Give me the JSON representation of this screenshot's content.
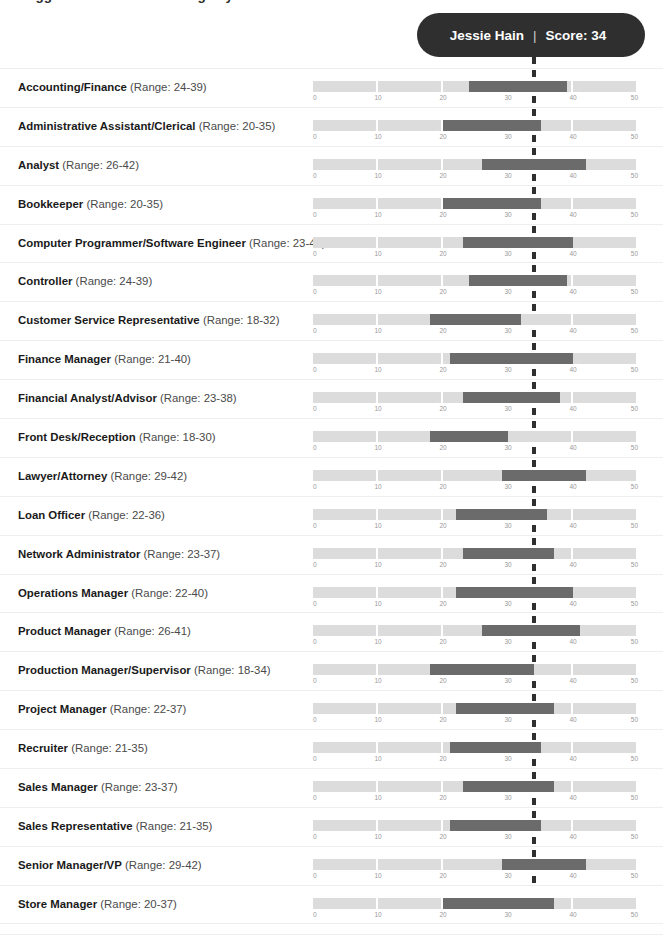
{
  "chart_title": "Suggested SCIM Score Range by Position",
  "badge": {
    "name": "Jessie Hain",
    "separator": "|",
    "score_label": "Score: 34",
    "score": 34,
    "background": "#2f2f2f",
    "text_color": "#ffffff"
  },
  "marker": {
    "name": "score-marker",
    "value": 34,
    "style": "dashed",
    "color": "#2f2f2f"
  },
  "axis": {
    "min": 0,
    "max": 50,
    "ticks": [
      0,
      10,
      20,
      30,
      40,
      50
    ],
    "tick_labels": [
      "0",
      "10",
      "20",
      "30",
      "40",
      "50"
    ],
    "segment_step": 10
  },
  "colors": {
    "track": "#dcdcdc",
    "fill": "#6b6b6b",
    "row_divider": "#eeeeee",
    "label": "#1a1a1a",
    "range_text": "#4a4a4a",
    "tick_text": "#9a9a9a",
    "page_background": "#ffffff"
  },
  "range_prefix": "(Range: ",
  "range_suffix": ")",
  "chart_data": {
    "type": "bar",
    "title": "Suggested SCIM Score Range by Position",
    "subtitle": "",
    "xlabel": "",
    "ylabel": "",
    "xlim": [
      0,
      50
    ],
    "grid": false,
    "legend": "none",
    "orientation": "horizontal-range",
    "marker_line": {
      "label": "Jessie Hain | Score: 34",
      "value": 34
    },
    "categories": [
      "Accounting/Finance",
      "Administrative Assistant/Clerical",
      "Analyst",
      "Bookkeeper",
      "Computer Programmer/Software Engineer",
      "Controller",
      "Customer Service Representative",
      "Finance Manager",
      "Financial Analyst/Advisor",
      "Front Desk/Reception",
      "Lawyer/Attorney",
      "Loan Officer",
      "Network Administrator",
      "Operations Manager",
      "Product Manager",
      "Production Manager/Supervisor",
      "Project Manager",
      "Recruiter",
      "Sales Manager",
      "Sales Representative",
      "Senior Manager/VP",
      "Store Manager"
    ],
    "range_low": [
      24,
      20,
      26,
      20,
      23,
      24,
      18,
      21,
      23,
      18,
      29,
      22,
      23,
      22,
      26,
      18,
      22,
      21,
      23,
      21,
      29,
      20
    ],
    "range_high": [
      39,
      35,
      42,
      35,
      40,
      39,
      32,
      40,
      38,
      30,
      42,
      36,
      37,
      40,
      41,
      34,
      37,
      35,
      37,
      35,
      42,
      37
    ]
  },
  "rows": [
    {
      "name": "Accounting/Finance",
      "range_text": "(Range: 24-39)",
      "low": 24,
      "high": 39
    },
    {
      "name": "Administrative Assistant/Clerical",
      "range_text": "(Range: 20-35)",
      "low": 20,
      "high": 35
    },
    {
      "name": "Analyst",
      "range_text": "(Range: 26-42)",
      "low": 26,
      "high": 42
    },
    {
      "name": "Bookkeeper",
      "range_text": "(Range: 20-35)",
      "low": 20,
      "high": 35
    },
    {
      "name": "Computer Programmer/Software Engineer",
      "range_text": "(Range: 23-40)",
      "low": 23,
      "high": 40
    },
    {
      "name": "Controller",
      "range_text": "(Range: 24-39)",
      "low": 24,
      "high": 39
    },
    {
      "name": "Customer Service Representative",
      "range_text": "(Range: 18-32)",
      "low": 18,
      "high": 32
    },
    {
      "name": "Finance Manager",
      "range_text": "(Range: 21-40)",
      "low": 21,
      "high": 40
    },
    {
      "name": "Financial Analyst/Advisor",
      "range_text": "(Range: 23-38)",
      "low": 23,
      "high": 38
    },
    {
      "name": "Front Desk/Reception",
      "range_text": "(Range: 18-30)",
      "low": 18,
      "high": 30
    },
    {
      "name": "Lawyer/Attorney",
      "range_text": "(Range: 29-42)",
      "low": 29,
      "high": 42
    },
    {
      "name": "Loan Officer",
      "range_text": "(Range: 22-36)",
      "low": 22,
      "high": 36
    },
    {
      "name": "Network Administrator",
      "range_text": "(Range: 23-37)",
      "low": 23,
      "high": 37
    },
    {
      "name": "Operations Manager",
      "range_text": "(Range: 22-40)",
      "low": 22,
      "high": 40
    },
    {
      "name": "Product Manager",
      "range_text": "(Range: 26-41)",
      "low": 26,
      "high": 41
    },
    {
      "name": "Production Manager/Supervisor",
      "range_text": "(Range: 18-34)",
      "low": 18,
      "high": 34
    },
    {
      "name": "Project Manager",
      "range_text": "(Range: 22-37)",
      "low": 22,
      "high": 37
    },
    {
      "name": "Recruiter",
      "range_text": "(Range: 21-35)",
      "low": 21,
      "high": 35
    },
    {
      "name": "Sales Manager",
      "range_text": "(Range: 23-37)",
      "low": 23,
      "high": 37
    },
    {
      "name": "Sales Representative",
      "range_text": "(Range: 21-35)",
      "low": 21,
      "high": 35
    },
    {
      "name": "Senior Manager/VP",
      "range_text": "(Range: 29-42)",
      "low": 29,
      "high": 42
    },
    {
      "name": "Store Manager",
      "range_text": "(Range: 20-37)",
      "low": 20,
      "high": 37
    }
  ]
}
